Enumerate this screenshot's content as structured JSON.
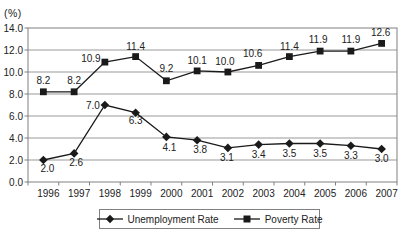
{
  "chart_data": {
    "type": "line",
    "unit_label": "(%)",
    "categories": [
      "1996",
      "1997",
      "1998",
      "1999",
      "2000",
      "2001",
      "2002",
      "2003",
      "2004",
      "2005",
      "2006",
      "2007"
    ],
    "series": [
      {
        "name": "Unemployment Rate",
        "marker": "diamond",
        "color": "#1a1a1a",
        "values": [
          2.0,
          2.6,
          7.0,
          6.3,
          4.1,
          3.8,
          3.1,
          3.4,
          3.5,
          3.5,
          3.3,
          3.0
        ],
        "labels": [
          "2.0",
          "2.6",
          "7.0",
          "6.3",
          "4.1",
          "3.8",
          "3.1",
          "3.4",
          "3.5",
          "3.5",
          "3.3",
          "3.0"
        ],
        "label_dx": [
          4,
          2,
          -12,
          0,
          3,
          3,
          -1,
          0,
          0,
          0,
          0,
          0
        ],
        "label_dy": [
          12,
          13,
          4,
          11,
          14,
          13,
          13,
          13,
          13,
          13,
          13,
          13
        ]
      },
      {
        "name": "Poverty Rate",
        "marker": "square",
        "color": "#1a1a1a",
        "values": [
          8.2,
          8.2,
          10.9,
          11.4,
          9.2,
          10.1,
          10.0,
          10.6,
          11.4,
          11.9,
          11.9,
          12.6
        ],
        "labels": [
          "8.2",
          "8.2",
          "10.9",
          "11.4",
          "9.2",
          "10.1",
          "10.0",
          "10.6",
          "11.4",
          "11.9",
          "11.9",
          "12.6"
        ],
        "label_dx": [
          0,
          0,
          -14,
          0,
          0,
          0,
          -3,
          -6,
          0,
          -2,
          0,
          -1
        ],
        "label_dy": [
          -8,
          -8,
          0,
          -7,
          -9,
          -7,
          -7,
          -8,
          -7,
          -8,
          -8,
          -7
        ]
      }
    ],
    "ylim": [
      0,
      14
    ],
    "ytick_step": 2,
    "ytick_labels": [
      "0.0",
      "2.0",
      "4.0",
      "6.0",
      "8.0",
      "10.0",
      "12.0",
      "14.0"
    ],
    "grid": true,
    "legend_position": "bottom"
  },
  "colors": {
    "line": "#1a1a1a",
    "grid": "#999999",
    "axis": "#808080",
    "text": "#222222",
    "background": "#ffffff"
  }
}
